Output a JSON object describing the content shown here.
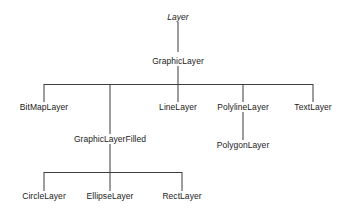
{
  "diagram": {
    "type": "class-inheritance-tree",
    "nodes": {
      "layer": {
        "label": "Layer",
        "abstract": true,
        "x": 178,
        "y": 18
      },
      "graphic_layer": {
        "label": "GraphicLayer",
        "abstract": false,
        "x": 178,
        "y": 62
      },
      "bitmap_layer": {
        "label": "BitMapLayer",
        "abstract": false,
        "x": 44,
        "y": 108
      },
      "graphic_layer_filled": {
        "label": "GraphicLayerFilled",
        "abstract": false,
        "x": 110,
        "y": 140
      },
      "line_layer": {
        "label": "LineLayer",
        "abstract": false,
        "x": 178,
        "y": 108
      },
      "polyline_layer": {
        "label": "PolylineLayer",
        "abstract": false,
        "x": 243,
        "y": 108
      },
      "text_layer": {
        "label": "TextLayer",
        "abstract": false,
        "x": 313,
        "y": 108
      },
      "polygon_layer": {
        "label": "PolygonLayer",
        "abstract": false,
        "x": 243,
        "y": 146
      },
      "circle_layer": {
        "label": "CircleLayer",
        "abstract": false,
        "x": 44,
        "y": 197
      },
      "ellipse_layer": {
        "label": "EllipseLayer",
        "abstract": false,
        "x": 110,
        "y": 197
      },
      "rect_layer": {
        "label": "RectLayer",
        "abstract": false,
        "x": 182,
        "y": 197
      }
    },
    "colors": {
      "background": "#ffffff",
      "line": "#3c3c3c",
      "text": "#1a1a1a"
    }
  }
}
